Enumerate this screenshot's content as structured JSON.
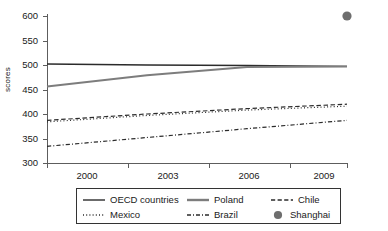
{
  "chart_data": {
    "type": "line",
    "title": "",
    "xlabel": "",
    "ylabel": "scores",
    "x": [
      2000,
      2003,
      2006,
      2009
    ],
    "xtick_labels": [
      "2000",
      "2003",
      "2006",
      "2009"
    ],
    "ytick_labels": [
      "300",
      "350",
      "400",
      "450",
      "500",
      "550",
      "600"
    ],
    "ylim": [
      300,
      600
    ],
    "xlim": [
      2000,
      2009
    ],
    "grid": false,
    "legend_position": "bottom",
    "series": [
      {
        "name": "OECD countries",
        "style": "solid",
        "color": "#2b2b2b",
        "width": 1.3,
        "values": [
          502,
          500,
          499,
          497
        ]
      },
      {
        "name": "Poland",
        "style": "solid",
        "color": "#7d7d7d",
        "width": 2.0,
        "values": [
          456,
          479,
          496,
          497
        ]
      },
      {
        "name": "Chile",
        "style": "dashed",
        "color": "#2b2b2b",
        "width": 1.2,
        "values": [
          387,
          400,
          411,
          420
        ]
      },
      {
        "name": "Mexico",
        "style": "dotted",
        "color": "#2b2b2b",
        "width": 1.2,
        "values": [
          384,
          397,
          408,
          416
        ]
      },
      {
        "name": "Brazil",
        "style": "dashdot",
        "color": "#2b2b2b",
        "width": 1.2,
        "values": [
          334,
          352,
          370,
          387
        ]
      }
    ],
    "points": [
      {
        "name": "Shanghai",
        "marker": "circle",
        "color": "#6e6e6e",
        "x": 2009,
        "y": 600
      }
    ]
  },
  "axis": {
    "ylabel": "scores",
    "yticks": [
      "600",
      "550",
      "500",
      "450",
      "400",
      "350",
      "300"
    ],
    "xticks": [
      "2000",
      "2003",
      "2006",
      "2009"
    ]
  },
  "legend": {
    "row1": [
      {
        "label": "OECD countries",
        "icon": "solid-line-icon"
      },
      {
        "label": "Poland",
        "icon": "thick-solid-line-icon"
      },
      {
        "label": "Chile",
        "icon": "dashed-line-icon"
      }
    ],
    "row2": [
      {
        "label": "Mexico",
        "icon": "dotted-line-icon"
      },
      {
        "label": "Brazil",
        "icon": "dash-dot-line-icon"
      },
      {
        "label": "Shanghai",
        "icon": "filled-circle-marker-icon"
      }
    ]
  }
}
